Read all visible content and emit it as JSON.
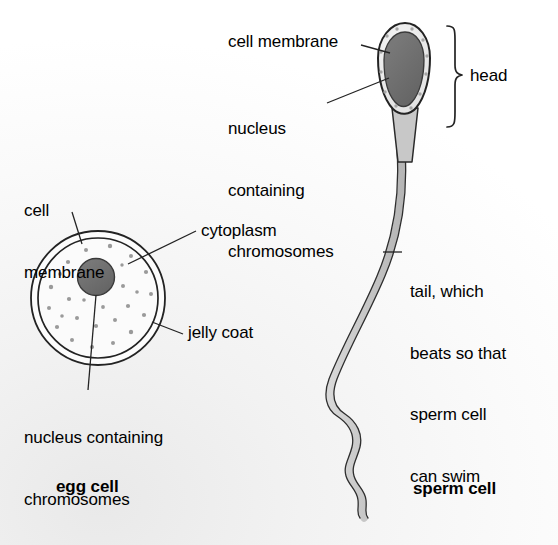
{
  "figure": {
    "background_color": "#f5f5f5",
    "ink_color": "#1a1a1a",
    "nucleus_fill": "#6e6e6e",
    "cytoplasm_fill": "#fbfbfb",
    "tail_fill": "#c9c9c9",
    "head_cytoplasm_fill": "#ededed"
  },
  "egg_cell": {
    "caption": "egg cell",
    "labels": {
      "cell_membrane": "cell\nmembrane",
      "cell_membrane_line1": "cell",
      "cell_membrane_line2": "membrane",
      "cytoplasm": "cytoplasm",
      "jelly_coat": "jelly coat",
      "nucleus": "nucleus containing\nchromosomes",
      "nucleus_line1": "nucleus containing",
      "nucleus_line2": "chromosomes"
    }
  },
  "sperm_cell": {
    "caption": "sperm cell",
    "labels": {
      "cell_membrane": "cell membrane",
      "nucleus": "nucleus\ncontaining\nchromosomes",
      "nucleus_line1": "nucleus",
      "nucleus_line2": "containing",
      "nucleus_line3": "chromosomes",
      "head": "head",
      "tail": "tail, which\nbeats so that\nsperm cell\ncan swim",
      "tail_line1": "tail, which",
      "tail_line2": "beats so that",
      "tail_line3": "sperm cell",
      "tail_line4": "can swim"
    }
  }
}
